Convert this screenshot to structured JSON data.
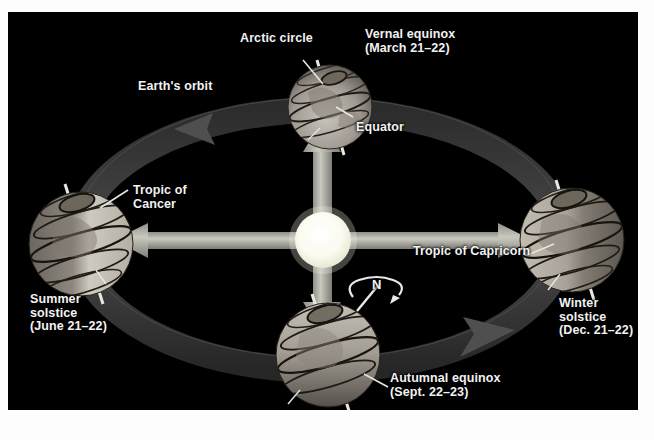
{
  "figure": {
    "background_color": "#ffffff",
    "panel_color": "#000000",
    "label_color": "#f2f2f2"
  },
  "labels": {
    "arctic_circle": "Arctic circle",
    "vernal_equinox": "Vernal equinox\n(March 21–22)",
    "earths_orbit": "Earth's orbit",
    "equator": "Equator",
    "tropic_of_cancer": "Tropic of\nCancer",
    "tropic_of_capricorn": "Tropic of Capricorn",
    "summer_solstice": "Summer\nsolstice\n(June 21–22)",
    "winter_solstice": "Winter\nsolstice\n(Dec. 21–22)",
    "autumnal_equinox": "Autumnal equinox\n(Sept. 22–23)",
    "north_pole": "N"
  },
  "diagram": {
    "sun": {
      "name": "sun",
      "center": [
        315,
        228
      ],
      "radius": 28,
      "color": "#fdfdf2"
    },
    "orbit": {
      "name": "earth-orbit-ellipse",
      "center": [
        313,
        228
      ],
      "radius_x": 243,
      "radius_y": 130,
      "band_color": "#3a3a3a",
      "direction": "counterclockwise"
    },
    "light_beams": {
      "color": "#b8b8b0",
      "directions": [
        "up",
        "down",
        "left",
        "right"
      ]
    },
    "globes": [
      {
        "name": "globe-vernal-equinox",
        "position": "top",
        "center": [
          322,
          95
        ],
        "radius": 42,
        "season_label": "vernal_equinox",
        "axis_tilt_deg": 23.5,
        "lit_side": "bottom"
      },
      {
        "name": "globe-summer-solstice",
        "position": "left",
        "center": [
          73,
          232
        ],
        "radius": 52,
        "season_label": "summer_solstice",
        "axis_tilt_deg": 23.5,
        "lit_side": "right"
      },
      {
        "name": "globe-winter-solstice",
        "position": "right",
        "center": [
          564,
          228
        ],
        "radius": 52,
        "season_label": "winter_solstice",
        "axis_tilt_deg": 23.5,
        "lit_side": "left"
      },
      {
        "name": "globe-autumnal-equinox",
        "position": "bottom",
        "center": [
          320,
          343
        ],
        "radius": 52,
        "season_label": "autumnal_equinox",
        "axis_tilt_deg": 23.5,
        "lit_side": "top"
      }
    ],
    "rotation_indicator": {
      "name": "earth-rotation-arrow",
      "label": "N",
      "position": [
        372,
        290
      ]
    }
  }
}
